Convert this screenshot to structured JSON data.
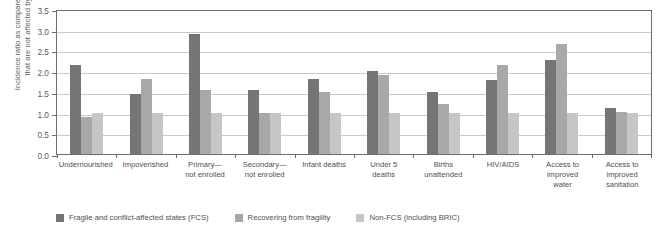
{
  "chart_data": {
    "type": "bar",
    "title": "",
    "subtitle": "",
    "xlabel": "",
    "ylabel": "Incidence ratio as compared to countries that are not affected by violence",
    "ylabel_lines": [
      "Incidence ratio as compared to countries",
      "that are not affected by violence"
    ],
    "ylim": [
      0,
      3.5
    ],
    "ytick_values": [
      0.0,
      0.5,
      1.0,
      1.5,
      2.0,
      2.5,
      3.0,
      3.5
    ],
    "ytick_labels": [
      "0.0",
      "0.5",
      "1.0",
      "1.5",
      "2.0",
      "2.5",
      "3.0",
      "3.5"
    ],
    "grid": true,
    "grid_axis": "y",
    "legend_position": "bottom-left",
    "categories": [
      "Undernourished",
      "Impoverished",
      "Primary—not enrolled",
      "Secondary—not enrolled",
      "Infant deaths",
      "Under 5 deaths",
      "Births unattended",
      "HIV/AIDS",
      "Access to improved water",
      "Access to improved sanitation"
    ],
    "category_lines": [
      [
        "Undernourished"
      ],
      [
        "Impoverished"
      ],
      [
        "Primary—",
        "not enrolled"
      ],
      [
        "Secondary—",
        "not enrolled"
      ],
      [
        "Infant deaths"
      ],
      [
        "Under 5",
        "deaths"
      ],
      [
        "Births",
        "unattended"
      ],
      [
        "HIV/AIDS"
      ],
      [
        "Access to",
        "improved",
        "water"
      ],
      [
        "Access to",
        "improved",
        "sanitation"
      ]
    ],
    "series": [
      {
        "name": "Fragile and conflict-affected states (FCS)",
        "color": "#757575",
        "values": [
          2.15,
          1.45,
          2.9,
          1.55,
          1.8,
          2.0,
          1.5,
          1.78,
          2.28,
          1.12
        ]
      },
      {
        "name": "Recovering from fragility",
        "color": "#a8a8a8",
        "values": [
          0.9,
          1.8,
          1.55,
          1.0,
          1.5,
          1.9,
          1.2,
          2.15,
          2.65,
          1.02
        ]
      },
      {
        "name": "Non-FCS (including BRIC)",
        "color": "#c6c6c6",
        "values": [
          1.0,
          1.0,
          1.0,
          1.0,
          1.0,
          1.0,
          1.0,
          1.0,
          1.0,
          1.0
        ]
      }
    ]
  },
  "legend": {
    "items": [
      {
        "label": "Fragile and conflict-affected states (FCS)",
        "color": "#757575"
      },
      {
        "label": "Recovering from fragility",
        "color": "#a8a8a8"
      },
      {
        "label": "Non-FCS (including BRIC)",
        "color": "#c6c6c6"
      }
    ]
  }
}
